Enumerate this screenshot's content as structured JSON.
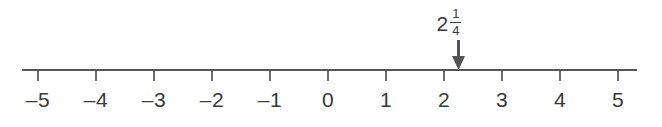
{
  "figure": {
    "type": "number-line",
    "background_color": "#ffffff",
    "ink_color": "#555555",
    "text_color": "#3a3a3a"
  },
  "chart_data": {
    "type": "line",
    "title": "",
    "xlabel": "",
    "ylabel": "",
    "subtitle": "",
    "orientation": "horizontal",
    "axis_range": [
      -5,
      5
    ],
    "tick_step": 1,
    "grid": false,
    "legend": false,
    "tick_labels": [
      "–5",
      "–4",
      "–3",
      "–2",
      "–1",
      "0",
      "1",
      "2",
      "3",
      "4",
      "5"
    ],
    "tick_values": [
      -5,
      -4,
      -3,
      -2,
      -1,
      0,
      1,
      2,
      3,
      4,
      5
    ],
    "annotations": [
      {
        "name": "marked-point",
        "value": 2.25,
        "label_whole": "2",
        "label_numerator": "1",
        "label_denominator": "4",
        "label_text": "2 1/4",
        "marker": "down-arrow"
      }
    ]
  },
  "axis": {
    "line_start_x": 22,
    "line_end_x": 637,
    "line_y": 70,
    "tick_first_x": 38,
    "tick_spacing": 58,
    "tick_length": 11
  },
  "labels": {
    "tick_label_y": 88,
    "point_label_y": 8
  },
  "arrow": {
    "top_y": 40,
    "tip_y": 70,
    "shaft_width": 3,
    "head_width": 13,
    "head_height": 14
  }
}
